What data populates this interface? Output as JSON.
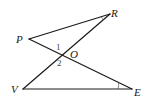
{
  "diagram": {
    "points": {
      "P": {
        "label": "P",
        "x": 29,
        "y": 39
      },
      "R": {
        "label": "R",
        "x": 110,
        "y": 14
      },
      "O": {
        "label": "O",
        "x": 61,
        "y": 55
      },
      "V": {
        "label": "V",
        "x": 23,
        "y": 89
      },
      "E": {
        "label": "E",
        "x": 132,
        "y": 89
      }
    },
    "segments": [
      {
        "from": "P",
        "to": "R"
      },
      {
        "from": "R",
        "to": "V"
      },
      {
        "from": "P",
        "to": "E"
      },
      {
        "from": "V",
        "to": "E"
      }
    ],
    "angle_labels": {
      "angle1": "1",
      "angle2": "2"
    },
    "angle_marks": [
      "R",
      "E"
    ],
    "stroke_color": "#1a1a1a"
  }
}
